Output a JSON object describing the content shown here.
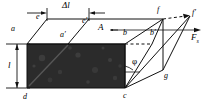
{
  "figure": {
    "type": "shear-deformation-block-diagram",
    "colors": {
      "stroke": "#111111",
      "fill_front_face": "#2a2a2a",
      "background": "#ffffff"
    },
    "labels": {
      "delta_l": "Δl",
      "length_l": "l",
      "area_A": "A",
      "angle_phi": "φ",
      "force": "F",
      "force_sub": "s",
      "vertex_a": "a",
      "vertex_a_prime": "a′",
      "vertex_b": "b",
      "vertex_b_prime": "b′",
      "vertex_c": "c",
      "vertex_d": "d",
      "vertex_e": "e",
      "vertex_e_prime": "e′",
      "vertex_f": "f",
      "vertex_f_prime": "f′",
      "vertex_g": "g"
    },
    "label_positions": {
      "delta_l": {
        "x": 64,
        "y": 2
      },
      "vertex_e": {
        "x": 36,
        "y": 13
      },
      "vertex_e_prime": {
        "x": 83,
        "y": 17
      },
      "vertex_f": {
        "x": 156,
        "y": 8
      },
      "vertex_f_prime": {
        "x": 192,
        "y": 10
      },
      "vertex_a": {
        "x": 12,
        "y": 26
      },
      "vertex_a_prime": {
        "x": 61,
        "y": 30
      },
      "area_A": {
        "x": 100,
        "y": 25
      },
      "vertex_b": {
        "x": 125,
        "y": 29
      },
      "vertex_b_prime": {
        "x": 152,
        "y": 29
      },
      "force": {
        "x": 192,
        "y": 34
      },
      "angle_phi": {
        "x": 133,
        "y": 60
      },
      "vertex_g": {
        "x": 164,
        "y": 74
      },
      "length_l": {
        "x": 9,
        "y": 66
      },
      "vertex_d": {
        "x": 24,
        "y": 96
      },
      "vertex_c": {
        "x": 124,
        "y": 95
      }
    }
  },
  "geometry": {
    "front_face_polygon": "27,44 89,44 125,36 125,80 27,80",
    "points": {
      "a": {
        "x": 27,
        "y": 44
      },
      "d": {
        "x": 27,
        "y": 88
      },
      "c": {
        "x": 125,
        "y": 88
      },
      "b": {
        "x": 125,
        "y": 44
      },
      "e": {
        "x": 47,
        "y": 19
      },
      "e2": {
        "x": 89,
        "y": 19
      },
      "f": {
        "x": 163,
        "y": 19
      },
      "f2": {
        "x": 190,
        "y": 16
      },
      "a2": {
        "x": 68,
        "y": 44
      },
      "b2": {
        "x": 163,
        "y": 44
      },
      "g": {
        "x": 163,
        "y": 70
      }
    }
  }
}
